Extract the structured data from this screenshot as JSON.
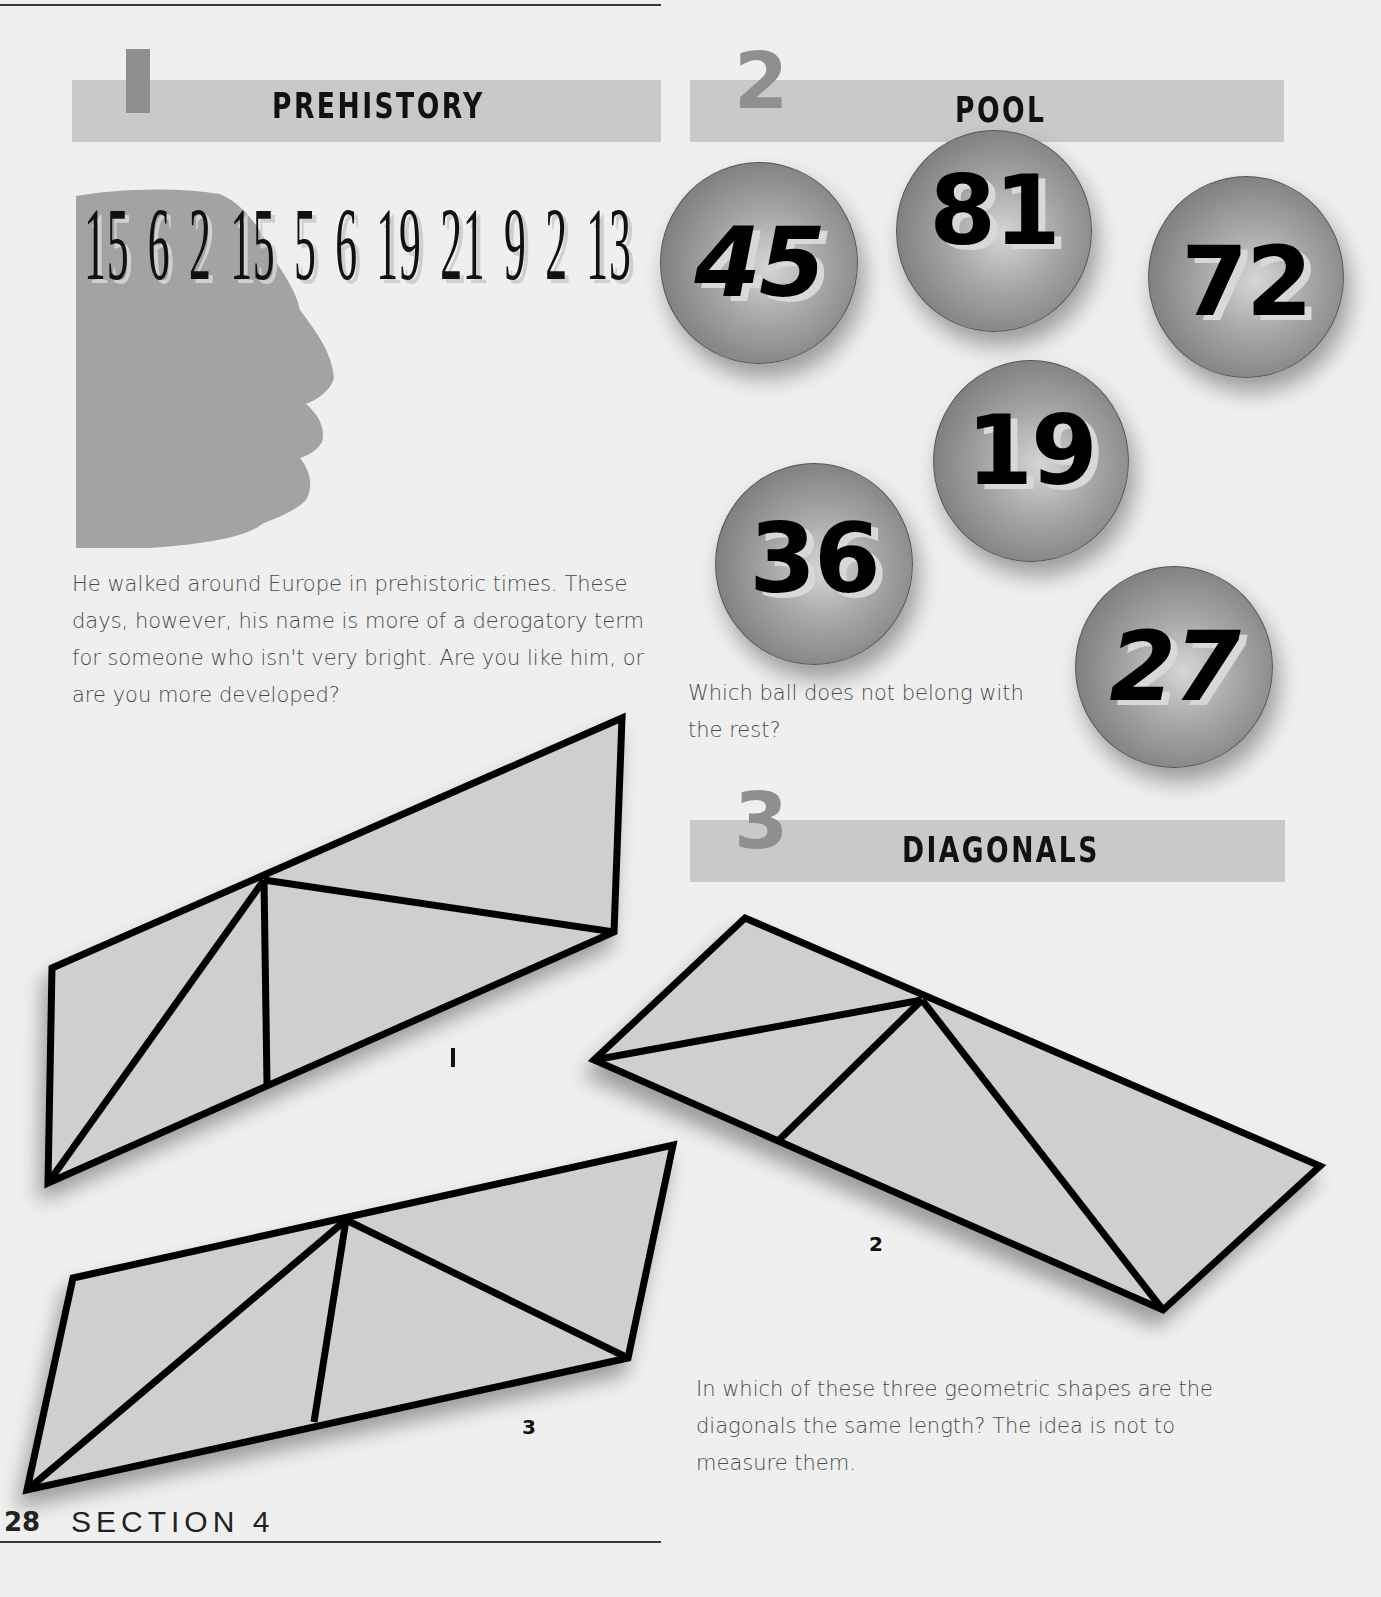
{
  "page": {
    "page_number": "28",
    "section_label": "SECTION 4"
  },
  "puzzles": [
    {
      "number": "1",
      "title": "PREHISTORY",
      "sequence": [
        "15",
        "6",
        "2",
        "15",
        "5",
        "6",
        "19",
        "21",
        "9",
        "2",
        "13"
      ],
      "text": "He walked around Europe in prehistoric times. These days, however, his name is more of a derogatory term for someone who isn't very bright. Are you like him, or are you more developed?",
      "text_lines": [
        "He walked around Europe in prehistoric times. These",
        "days, however, his name is more of a derogatory term",
        "for someone who isn't very bright. Are you like him, or",
        "are you more developed?"
      ]
    },
    {
      "number": "2",
      "title": "POOL",
      "balls": [
        "45",
        "81",
        "72",
        "19",
        "36",
        "27"
      ],
      "text_lines": [
        "Which ball does not belong with",
        "the rest?"
      ]
    },
    {
      "number": "3",
      "title": "DIAGONALS",
      "shape_labels": [
        "1",
        "2",
        "3"
      ],
      "text_lines": [
        "In which of these three geometric shapes are the",
        "diagonals the same length? The idea is not to",
        "measure them."
      ]
    }
  ],
  "colors": {
    "background": "#efefef",
    "band": "#c9c9c9",
    "band_number": "#8f8f8f",
    "silhouette": "#a3a3a3",
    "shape_fill": "#cfcfcf",
    "ink": "#111111"
  }
}
